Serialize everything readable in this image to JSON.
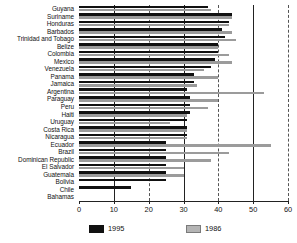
{
  "chart_data": {
    "type": "bar",
    "orientation": "horizontal",
    "title": "",
    "xlabel": "",
    "ylabel": "",
    "xlim": [
      0,
      60
    ],
    "xticks": [
      0,
      10,
      20,
      30,
      40,
      50,
      60
    ],
    "grid": true,
    "legend_position": "bottom",
    "categories": [
      "Guyana",
      "Suriname",
      "Honduras",
      "Barbados",
      "Trinidad and Tobago",
      "Belize",
      "Colombia",
      "Mexico",
      "Venezuela",
      "Panama",
      "Jamaica",
      "Argentina",
      "Paraguay",
      "Peru",
      "Haiti",
      "Uruguay",
      "Costa Rica",
      "Nicaragua",
      "Ecuador",
      "Brazil",
      "Dominican Republic",
      "El Salvador",
      "Guatemala",
      "Bolivia",
      "Chile",
      "Bahamas"
    ],
    "series": [
      {
        "name": "1995",
        "color": "#111111",
        "values": [
          37,
          44,
          43,
          41,
          42,
          40,
          40,
          39,
          38,
          33,
          33,
          31,
          32,
          32,
          32,
          31,
          31,
          31,
          25,
          25,
          25,
          25,
          25,
          25,
          15,
          0
        ]
      },
      {
        "name": "1986",
        "color": "#9b9b9b",
        "values": [
          38,
          44,
          43,
          44,
          45,
          40,
          43,
          44,
          36,
          40,
          34,
          53,
          40,
          37,
          31,
          26,
          31,
          31,
          55,
          43,
          38,
          30,
          30,
          0,
          0,
          0
        ]
      }
    ]
  },
  "legend": {
    "items": [
      {
        "label": "1995",
        "color": "#111111"
      },
      {
        "label": "1986",
        "color": "#b4b4b4"
      }
    ]
  },
  "axis": {
    "tick_labels": [
      "0",
      "10",
      "20",
      "30",
      "40",
      "50",
      "60"
    ]
  },
  "footer": {
    "note": ""
  }
}
